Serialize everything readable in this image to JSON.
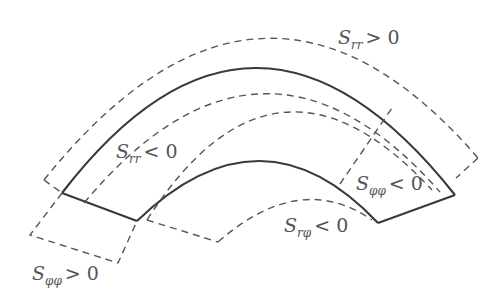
{
  "diagram": {
    "type": "stress-sign-regions-annular-sector",
    "colors": {
      "solid": "#3a3a3a",
      "dashed": "#555555",
      "text": "#555555",
      "background": "#ffffff"
    },
    "labels": [
      {
        "id": "srr_pos",
        "symbol": "S",
        "subscript": "rr",
        "relation": "> 0",
        "x": 338,
        "y": 44
      },
      {
        "id": "srr_neg",
        "symbol": "S",
        "subscript": "rr",
        "relation": "< 0",
        "x": 116,
        "y": 158
      },
      {
        "id": "sphiphi_neg",
        "symbol": "S",
        "subscript": "φφ",
        "relation": "< 0",
        "x": 356,
        "y": 190
      },
      {
        "id": "srphi_neg",
        "symbol": "S",
        "subscript": "rφ",
        "relation": "< 0",
        "x": 284,
        "y": 232
      },
      {
        "id": "sphiphi_pos",
        "symbol": "S",
        "subscript": "φφ",
        "relation": "> 0",
        "x": 32,
        "y": 280
      }
    ]
  }
}
